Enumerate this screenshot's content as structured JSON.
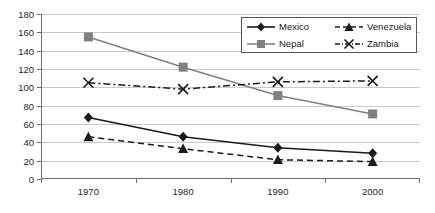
{
  "chart_data": {
    "type": "line",
    "title": "",
    "xlabel": "",
    "ylabel": "",
    "categories": [
      "1970",
      "1980",
      "1990",
      "2000"
    ],
    "ylim": [
      0,
      180
    ],
    "ytick_labels": [
      "0",
      "20",
      "40",
      "60",
      "80",
      "100",
      "120",
      "140",
      "160",
      "180"
    ],
    "ytick_values": [
      0,
      20,
      40,
      60,
      80,
      100,
      120,
      140,
      160,
      180
    ],
    "grid": true,
    "legend_position": "top-right",
    "series": [
      {
        "name": "Mexico",
        "values": [
          67,
          46,
          34,
          28
        ],
        "marker": "diamond",
        "line": "solid",
        "color": "#1a1a1a"
      },
      {
        "name": "Venezuela",
        "values": [
          46,
          33,
          21,
          19
        ],
        "marker": "triangle",
        "line": "dashed",
        "color": "#1a1a1a"
      },
      {
        "name": "Nepal",
        "values": [
          155,
          122,
          91,
          71
        ],
        "marker": "square",
        "line": "solid",
        "color": "#808080"
      },
      {
        "name": "Zambia",
        "values": [
          105,
          98,
          106,
          107
        ],
        "marker": "x",
        "line": "dashdot",
        "color": "#1a1a1a"
      }
    ]
  },
  "legend": {
    "entries": [
      {
        "label": "Mexico"
      },
      {
        "label": "Venezuela"
      },
      {
        "label": "Nepal"
      },
      {
        "label": "Zambia"
      }
    ]
  },
  "colors": {
    "gridline": "#c9c9c9",
    "axis": "#6e6e6e",
    "dark_series": "#1a1a1a",
    "gray_series": "#808080",
    "legend_border": "#555555",
    "background": "#ffffff"
  }
}
